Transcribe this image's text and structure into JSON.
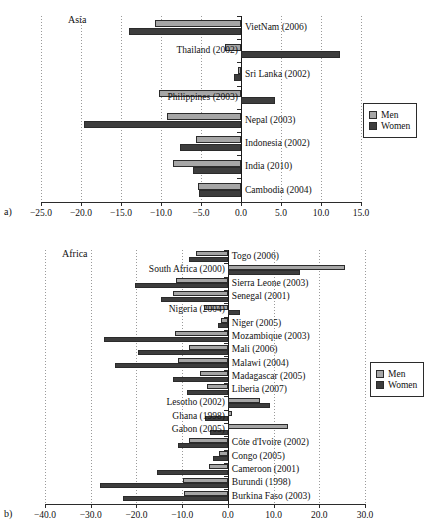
{
  "legend": {
    "men_label": "Men",
    "women_label": "Women"
  },
  "panels": [
    {
      "key": "a",
      "panel_label": "a)",
      "region_label": "Asia"
    },
    {
      "key": "b",
      "panel_label": "b)",
      "region_label": "Africa"
    }
  ],
  "chart_data": [
    {
      "type": "bar",
      "orientation": "horizontal",
      "title": "Asia",
      "panel": "a)",
      "xlabel": "",
      "ylabel": "",
      "xlim": [
        -25.0,
        15.0
      ],
      "xticks": [
        -25.0,
        -20.0,
        -15.0,
        -10.0,
        -5.0,
        0.0,
        5.0,
        10.0,
        15.0
      ],
      "xticklabels": [
        "-25.0",
        "-20.0",
        "-15.0",
        "-10.0",
        "-5.0",
        "0.0",
        "5.0",
        "10.0",
        "15.0"
      ],
      "grid": true,
      "legend": [
        "Men",
        "Women"
      ],
      "legend_position": "right",
      "categories": [
        "VietNam (2006)",
        "Thailand (2002)",
        "Sri Lanka (2002)",
        "Philippines (2003)",
        "Nepal (2003)",
        "Indonesia (2002)",
        "India (2010)",
        "Cambodia (2004)"
      ],
      "series": [
        {
          "name": "Men",
          "values": [
            -10.7,
            -2.0,
            -0.4,
            -10.3,
            -9.2,
            -5.6,
            -8.5,
            -5.4
          ]
        },
        {
          "name": "Women",
          "values": [
            -14.0,
            12.4,
            -0.9,
            4.2,
            -19.6,
            -7.6,
            -6.0,
            -5.2
          ]
        }
      ]
    },
    {
      "type": "bar",
      "orientation": "horizontal",
      "title": "Africa",
      "panel": "b)",
      "xlabel": "",
      "ylabel": "",
      "xlim": [
        -40.0,
        30.0
      ],
      "xticks": [
        -40.0,
        -30.0,
        -20.0,
        -10.0,
        0.0,
        10.0,
        20.0,
        30.0
      ],
      "xticklabels": [
        "-40.0",
        "-30.0",
        "-20.0",
        "-10.0",
        "0.0",
        "10.0",
        "20.0",
        "30.0"
      ],
      "grid": true,
      "legend": [
        "Men",
        "Women"
      ],
      "legend_position": "right",
      "categories": [
        "Togo (2006)",
        "South Africa (2000)",
        "Sierra Leone (2003)",
        "Senegal (2001)",
        "Nigeria (2004)",
        "Niger (2005)",
        "Mozambique (2003)",
        "Mali (2006)",
        "Malawi (2004)",
        "Madagascar (2005)",
        "Liberia (2007)",
        "Lesotho (2002)",
        "Ghana (1998)",
        "Gabon (2005)",
        "Côte d'Ivoire (2002)",
        "Congo (2005)",
        "Cameroon (2001)",
        "Burundi (1998)",
        "Burkina Faso (2003)"
      ],
      "series": [
        {
          "name": "Men",
          "values": [
            -7.0,
            25.6,
            -11.3,
            -12.0,
            -5.2,
            -1.4,
            -11.5,
            -8.6,
            -10.8,
            -6.2,
            -4.6,
            7.0,
            1.0,
            13.1,
            -8.4,
            -2.0,
            -4.2,
            -9.8,
            -9.6
          ]
        },
        {
          "name": "Women",
          "values": [
            -8.5,
            15.8,
            -20.4,
            -14.6,
            2.6,
            -2.1,
            -27.0,
            -19.6,
            -24.7,
            -12.0,
            -9.0,
            9.2,
            -5.0,
            -4.0,
            -11.0,
            -3.2,
            -15.6,
            -28.0,
            -23.0
          ]
        }
      ]
    }
  ]
}
